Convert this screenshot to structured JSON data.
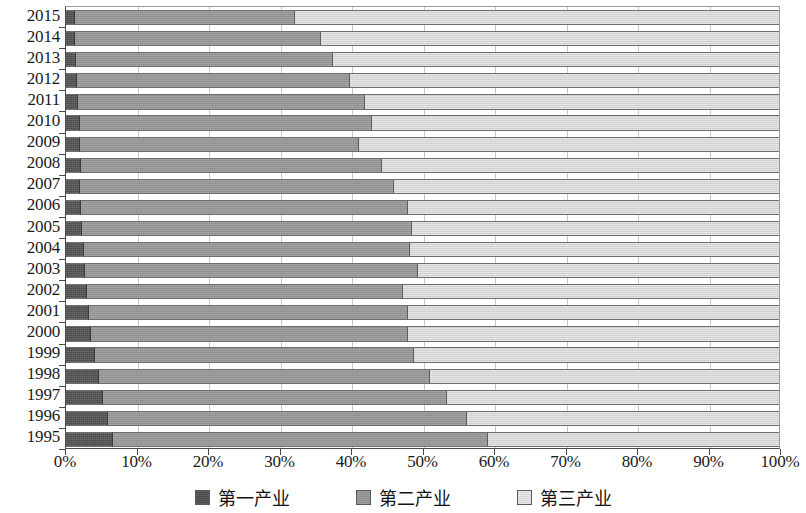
{
  "chart_data": {
    "type": "bar",
    "subtype": "horizontal-stacked-100-percent",
    "title": "",
    "xlabel": "",
    "ylabel": "",
    "xlim": [
      0,
      100
    ],
    "grid": true,
    "legend_position": "bottom",
    "categories": [
      "2015",
      "2014",
      "2013",
      "2012",
      "2011",
      "2010",
      "2009",
      "2008",
      "2007",
      "2006",
      "2005",
      "2004",
      "2003",
      "2002",
      "2001",
      "2000",
      "1999",
      "1998",
      "1997",
      "1996",
      "1995"
    ],
    "xticks": [
      "0%",
      "10%",
      "20%",
      "30%",
      "40%",
      "50%",
      "60%",
      "70%",
      "80%",
      "90%",
      "100%"
    ],
    "xtick_values": [
      0,
      10,
      20,
      30,
      40,
      50,
      60,
      70,
      80,
      90,
      100
    ],
    "series": [
      {
        "name": "第一产业",
        "color": "#4b4b4b",
        "values": [
          1.2,
          1.3,
          1.4,
          1.6,
          1.7,
          1.9,
          2.0,
          2.1,
          2.0,
          2.1,
          2.3,
          2.5,
          2.7,
          2.9,
          3.2,
          3.5,
          4.0,
          4.6,
          5.2,
          5.9,
          6.6
        ]
      },
      {
        "name": "第二产业",
        "color": "#8e8e8e",
        "values": [
          30.9,
          34.4,
          36.1,
          38.3,
          40.2,
          41.0,
          39.1,
          42.2,
          44.0,
          45.8,
          46.2,
          45.8,
          46.6,
          44.4,
          44.7,
          44.5,
          44.8,
          46.4,
          48.2,
          50.3,
          52.6
        ]
      },
      {
        "name": "第三产业",
        "color": "#d6d6d6",
        "values": [
          67.9,
          64.3,
          62.5,
          60.1,
          58.1,
          57.1,
          58.9,
          55.7,
          54.0,
          52.1,
          51.5,
          51.7,
          50.7,
          52.7,
          52.1,
          52.0,
          51.2,
          49.0,
          46.6,
          43.8,
          40.8
        ]
      }
    ]
  },
  "legend": {
    "items": [
      {
        "label": "第一产业",
        "swatch": "s1"
      },
      {
        "label": "第二产业",
        "swatch": "s2"
      },
      {
        "label": "第三产业",
        "swatch": "s3"
      }
    ]
  }
}
